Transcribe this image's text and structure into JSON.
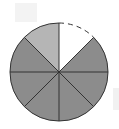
{
  "diagram": {
    "type": "fraction-circle",
    "total_parts": 8,
    "description": "Circle divided into 8 equal parts; 6 shaded dark, 1 shaded light, 1 unshaded with dashed outline",
    "center": [
      59,
      72
    ],
    "radius": 49,
    "slices": [
      {
        "index": 0,
        "start_deg": 0,
        "end_deg": 45,
        "fill": "#ffffff",
        "style": "unshaded-dashed"
      },
      {
        "index": 1,
        "start_deg": 45,
        "end_deg": 90,
        "fill": "#8c8c8c",
        "style": "shaded-dark"
      },
      {
        "index": 2,
        "start_deg": 90,
        "end_deg": 135,
        "fill": "#8c8c8c",
        "style": "shaded-dark"
      },
      {
        "index": 3,
        "start_deg": 135,
        "end_deg": 180,
        "fill": "#8c8c8c",
        "style": "shaded-dark"
      },
      {
        "index": 4,
        "start_deg": 180,
        "end_deg": 225,
        "fill": "#8c8c8c",
        "style": "shaded-dark"
      },
      {
        "index": 5,
        "start_deg": 225,
        "end_deg": 270,
        "fill": "#8c8c8c",
        "style": "shaded-dark"
      },
      {
        "index": 6,
        "start_deg": 270,
        "end_deg": 315,
        "fill": "#8c8c8c",
        "style": "shaded-dark"
      },
      {
        "index": 7,
        "start_deg": 315,
        "end_deg": 360,
        "fill": "#b5b5b5",
        "style": "shaded-light"
      }
    ],
    "colors": {
      "dark": "#8c8c8c",
      "light": "#b5b5b5",
      "empty": "#ffffff",
      "stroke": "#333333"
    }
  }
}
